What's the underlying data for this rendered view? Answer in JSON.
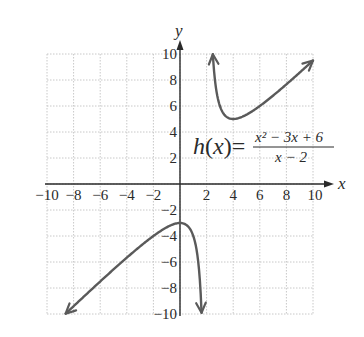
{
  "chart_data": {
    "type": "line",
    "title": "",
    "function_label": "h(x) =",
    "numerator": "x² − 3x + 6",
    "denominator": "x − 2",
    "formula": "(x^2 - 3x + 6)/(x - 2)",
    "xlabel": "x",
    "ylabel": "y",
    "xlim": [
      -10,
      10
    ],
    "ylim": [
      -10,
      10
    ],
    "grid": true,
    "grid_step": 2,
    "x_ticks": [
      "−10",
      "−8",
      "−6",
      "−4",
      "−2",
      "2",
      "4",
      "6",
      "8",
      "10"
    ],
    "x_tick_values": [
      -10,
      -8,
      -6,
      -4,
      -2,
      2,
      4,
      6,
      8,
      10
    ],
    "y_ticks": [
      "10",
      "8",
      "6",
      "4",
      "2",
      "−2",
      "−4",
      "−6",
      "−8",
      "−10"
    ],
    "y_tick_values": [
      10,
      8,
      6,
      4,
      2,
      -2,
      -4,
      -6,
      -8,
      -10
    ],
    "vertical_asymptote": 2,
    "oblique_asymptote": "y = x - 1",
    "series": [
      {
        "name": "upper branch",
        "x_range": [
          2.47,
          10
        ],
        "points": [
          [
            2.47,
            10.0
          ],
          [
            2.5,
            9.5
          ],
          [
            3,
            6.0
          ],
          [
            4,
            5.0
          ],
          [
            5,
            5.33
          ],
          [
            6,
            6.0
          ],
          [
            8,
            7.67
          ],
          [
            10,
            9.5
          ]
        ],
        "arrows": [
          "start",
          "end"
        ]
      },
      {
        "name": "lower branch",
        "x_range": [
          -8.6,
          1.62
        ],
        "points": [
          [
            -8.6,
            -10.0
          ],
          [
            -8,
            -9.4
          ],
          [
            -6,
            -7.5
          ],
          [
            -4,
            -5.67
          ],
          [
            -2,
            -4.0
          ],
          [
            0,
            -3.0
          ],
          [
            1,
            -4.0
          ],
          [
            1.5,
            -7.5
          ],
          [
            1.62,
            -9.9
          ]
        ],
        "arrows": [
          "start",
          "end"
        ]
      }
    ],
    "key_points": {
      "local_min": [
        4,
        5
      ],
      "local_max": [
        0,
        -3
      ]
    },
    "curve_color": "#5a5a5a",
    "axis_color": "#2a2a2a",
    "grid_color": "#c8c8c8"
  }
}
